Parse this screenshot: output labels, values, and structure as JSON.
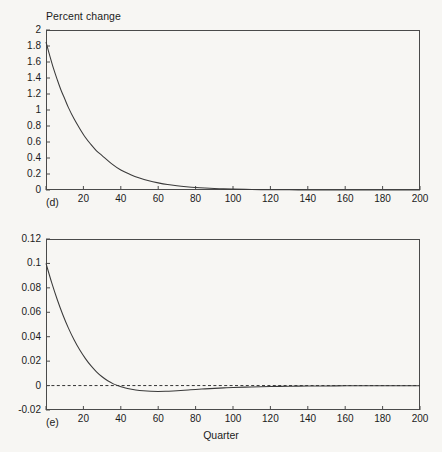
{
  "figure": {
    "background_color": "#f7f6f3",
    "line_color": "#3a3a3a",
    "axis_color": "#4a4a4a"
  },
  "chart_data": [
    {
      "type": "line",
      "panel_label": "(d)",
      "title": "Percent change",
      "xlabel": "",
      "ylabel": "Percent change",
      "xlim": [
        0,
        200
      ],
      "ylim": [
        0,
        2
      ],
      "grid": false,
      "legend": "none",
      "xticks": [
        0,
        20,
        40,
        60,
        80,
        100,
        120,
        140,
        160,
        180,
        200
      ],
      "xtick_labels": [
        "",
        "20",
        "40",
        "60",
        "80",
        "100",
        "120",
        "140",
        "160",
        "180",
        "200"
      ],
      "yticks": [
        0,
        0.2,
        0.4,
        0.6,
        0.8,
        1,
        1.2,
        1.4,
        1.6,
        1.8,
        2
      ],
      "ytick_labels": [
        "0",
        "0.2",
        "0.4",
        "0.6",
        "0.8",
        "1",
        "1.2",
        "1.4",
        "1.6",
        "1.8",
        "2"
      ],
      "series": [
        {
          "name": "percent change",
          "x": [
            0,
            2,
            4,
            6,
            8,
            10,
            12,
            15,
            18,
            21,
            24,
            27,
            30,
            35,
            40,
            45,
            50,
            55,
            60,
            65,
            70,
            75,
            80,
            85,
            90,
            95,
            100,
            110,
            120,
            130,
            140,
            150,
            160,
            170,
            180,
            190,
            200
          ],
          "values": [
            1.85,
            1.68,
            1.52,
            1.38,
            1.25,
            1.14,
            1.03,
            0.89,
            0.77,
            0.66,
            0.57,
            0.49,
            0.43,
            0.33,
            0.25,
            0.195,
            0.15,
            0.115,
            0.089,
            0.068,
            0.053,
            0.041,
            0.031,
            0.024,
            0.019,
            0.014,
            0.011,
            0.0065,
            0.0038,
            0.0023,
            0.0013,
            0.0008,
            0.0005,
            0.0003,
            0.0002,
            0.0001,
            0.0001
          ]
        }
      ]
    },
    {
      "type": "line",
      "panel_label": "(e)",
      "title": "",
      "xlabel": "Quarter",
      "ylabel": "",
      "xlim": [
        0,
        200
      ],
      "ylim": [
        -0.02,
        0.12
      ],
      "grid": false,
      "legend": "none",
      "zero_line": 0,
      "zero_line_style": "dashed",
      "xticks": [
        0,
        20,
        40,
        60,
        80,
        100,
        120,
        140,
        160,
        180,
        200
      ],
      "xtick_labels": [
        "",
        "20",
        "40",
        "60",
        "80",
        "100",
        "120",
        "140",
        "160",
        "180",
        "200"
      ],
      "yticks": [
        -0.02,
        0,
        0.02,
        0.04,
        0.06,
        0.08,
        0.1,
        0.12
      ],
      "ytick_labels": [
        "-0.02",
        "0",
        "0.02",
        "0.04",
        "0.06",
        "0.08",
        "0.1",
        "0.12"
      ],
      "series": [
        {
          "name": "percent change",
          "x": [
            0,
            3,
            6,
            9,
            12,
            15,
            18,
            21,
            24,
            27,
            30,
            33,
            36,
            39,
            42,
            45,
            48,
            52,
            56,
            60,
            64,
            68,
            72,
            76,
            80,
            85,
            90,
            95,
            100,
            110,
            120,
            130,
            140,
            150,
            160,
            170,
            180,
            190,
            200
          ],
          "values": [
            0.1,
            0.0845,
            0.0705,
            0.058,
            0.047,
            0.0375,
            0.0293,
            0.0223,
            0.0163,
            0.0113,
            0.0072,
            0.0039,
            0.0014,
            -0.0004,
            -0.0017,
            -0.0028,
            -0.0036,
            -0.0043,
            -0.0047,
            -0.0048,
            -0.0047,
            -0.0044,
            -0.004,
            -0.0036,
            -0.0032,
            -0.0027,
            -0.0023,
            -0.0019,
            -0.0016,
            -0.0011,
            -0.0008,
            -0.0005,
            -0.0004,
            -0.0003,
            -0.0002,
            -0.0001,
            -0.0001,
            -0.0001,
            -0.0001
          ]
        }
      ]
    }
  ]
}
